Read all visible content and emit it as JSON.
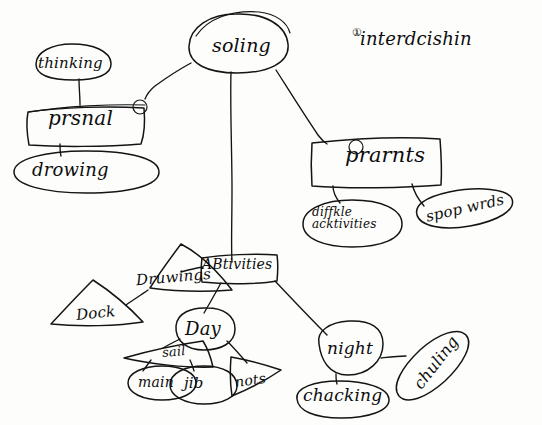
{
  "diagram": {
    "medium": "hand-drawn pencil sketch on white paper",
    "ink_color": "#141414",
    "paper_color": "#fdfdfc",
    "nodes": {
      "root": {
        "text": "soling",
        "shape": "oval"
      },
      "heading": {
        "number": "①",
        "text": "interdcishin",
        "shape": "none"
      },
      "thinking": {
        "text": "thinking",
        "shape": "oval"
      },
      "prsnal": {
        "text": "prsnal",
        "number": "①",
        "shape": "box"
      },
      "drowing": {
        "text": "drowing",
        "shape": "oval"
      },
      "prarnts": {
        "text": "prarnts",
        "number": "②",
        "shape": "box"
      },
      "diffkle": {
        "text_line1": "diffkle",
        "text_line2": "acktivities",
        "shape": "oval"
      },
      "spop_wrds": {
        "text": "spop wrds",
        "shape": "oval"
      },
      "druwings": {
        "text": "Druwings",
        "shape": "triangle"
      },
      "activities": {
        "text": "ABtivities",
        "shape": "box"
      },
      "dock": {
        "text": "Dock",
        "shape": "triangle"
      },
      "day": {
        "text": "Day",
        "shape": "oval"
      },
      "sail": {
        "text": "sail",
        "shape": "triangle"
      },
      "main": {
        "text": "main",
        "shape": "oval"
      },
      "jib": {
        "text": "jib",
        "shape": "oval"
      },
      "nots": {
        "text": "nots",
        "shape": "triangle"
      },
      "night": {
        "text": "night",
        "shape": "oval"
      },
      "chacking": {
        "text": "chacking",
        "shape": "oval"
      },
      "chuling": {
        "text": "chuling",
        "shape": "oval"
      }
    },
    "edges": [
      {
        "from": "root",
        "to": "prsnal"
      },
      {
        "from": "root",
        "to": "activities"
      },
      {
        "from": "root",
        "to": "prarnts"
      },
      {
        "from": "thinking",
        "to": "prsnal"
      },
      {
        "from": "prsnal",
        "to": "drowing"
      },
      {
        "from": "prarnts",
        "to": "diffkle"
      },
      {
        "from": "prarnts",
        "to": "spop_wrds"
      },
      {
        "from": "activities",
        "to": "druwings"
      },
      {
        "from": "activities",
        "to": "day"
      },
      {
        "from": "activities",
        "to": "night"
      },
      {
        "from": "druwings",
        "to": "dock"
      },
      {
        "from": "day",
        "to": "sail"
      },
      {
        "from": "day",
        "to": "nots"
      },
      {
        "from": "sail",
        "to": "main"
      },
      {
        "from": "sail",
        "to": "jib"
      },
      {
        "from": "night",
        "to": "chacking"
      },
      {
        "from": "night",
        "to": "chuling"
      }
    ]
  }
}
